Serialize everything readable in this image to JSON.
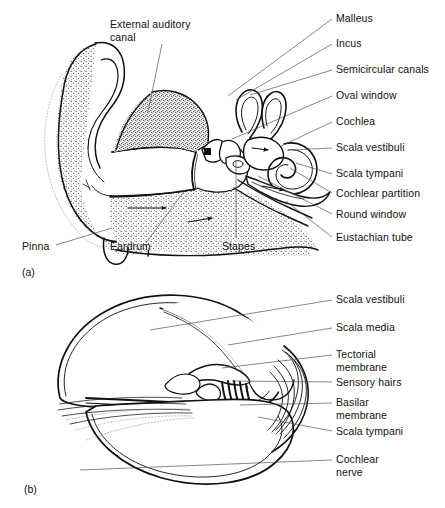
{
  "figure": {
    "background_color": "#ffffff",
    "ink_color": "#111111",
    "width": 445,
    "height": 508
  },
  "panels": [
    {
      "id": "(a)",
      "name": "outer-middle-inner-ear-overview",
      "id_x": 22,
      "id_y": 266,
      "labels": [
        {
          "name": "external-auditory-canal",
          "text": "External auditory\ncanal",
          "x": 110,
          "y": 18,
          "lines": 2,
          "leader": [
            [
              162,
              44
            ],
            [
              148,
              112
            ]
          ]
        },
        {
          "name": "malleus",
          "text": "Malleus",
          "x": 336,
          "y": 12,
          "leader": [
            [
              332,
              19
            ],
            [
              228,
              96
            ]
          ]
        },
        {
          "name": "incus",
          "text": "Incus",
          "x": 336,
          "y": 37,
          "leader": [
            [
              332,
              44
            ],
            [
              236,
              100
            ]
          ]
        },
        {
          "name": "semicircular-canals",
          "text": "Semicircular canals",
          "x": 336,
          "y": 63,
          "leader": [
            [
              332,
              70
            ],
            [
              250,
              95
            ]
          ]
        },
        {
          "name": "oval-window",
          "text": "Oval window",
          "x": 336,
          "y": 89,
          "leader": [
            [
              332,
              96
            ],
            [
              232,
              139
            ]
          ]
        },
        {
          "name": "cochlea",
          "text": "Cochlea",
          "x": 336,
          "y": 115,
          "leader": [
            [
              332,
              122
            ],
            [
              281,
              146
            ]
          ]
        },
        {
          "name": "scala-vestibuli",
          "text": "Scala vestibuli",
          "x": 336,
          "y": 141,
          "leader": [
            [
              332,
              148
            ],
            [
              292,
              150
            ]
          ]
        },
        {
          "name": "scala-tympani",
          "text": "Scala tympani",
          "x": 336,
          "y": 167,
          "leader": [
            [
              332,
              174
            ],
            [
              296,
              163
            ]
          ]
        },
        {
          "name": "cochlear-partition",
          "text": "Cochlear partition",
          "x": 336,
          "y": 187,
          "leader": [
            [
              332,
              193
            ],
            [
              290,
              168
            ]
          ]
        },
        {
          "name": "round-window",
          "text": "Round window",
          "x": 336,
          "y": 208,
          "leader": [
            [
              332,
              214
            ],
            [
              258,
              176
            ]
          ]
        },
        {
          "name": "eustachian-tube",
          "text": "Eustachian tube",
          "x": 336,
          "y": 231,
          "leader": [
            [
              332,
              237
            ],
            [
              286,
              201
            ]
          ]
        },
        {
          "name": "pinna",
          "text": "Pinna",
          "x": 22,
          "y": 240,
          "leader": [
            [
              56,
              245
            ],
            [
              112,
              228
            ]
          ]
        },
        {
          "name": "eardrum",
          "text": "Eardrum",
          "x": 110,
          "y": 240,
          "leader": [
            [
              146,
              243
            ],
            [
              185,
              190
            ]
          ]
        },
        {
          "name": "stapes",
          "text": "Stapes",
          "x": 222,
          "y": 240,
          "leader": [
            [
              236,
              238
            ],
            [
              236,
              160
            ]
          ]
        }
      ]
    },
    {
      "id": "(b)",
      "name": "cochlear-cross-section",
      "id_x": 24,
      "id_y": 483,
      "labels": [
        {
          "name": "scala-vestibuli-b",
          "text": "Scala vestibuli",
          "x": 336,
          "y": 293,
          "leader": [
            [
              332,
              300
            ],
            [
              150,
              330
            ]
          ]
        },
        {
          "name": "scala-media",
          "text": "Scala media",
          "x": 336,
          "y": 321,
          "leader": [
            [
              332,
              328
            ],
            [
              228,
              345
            ]
          ]
        },
        {
          "name": "tectorial-membrane",
          "text": "Tectorial\nmembrane",
          "x": 336,
          "y": 348,
          "lines": 2,
          "leader": [
            [
              332,
              355
            ],
            [
              222,
              368
            ]
          ]
        },
        {
          "name": "sensory-hairs",
          "text": "Sensory hairs",
          "x": 336,
          "y": 376,
          "leader": [
            [
              332,
              382
            ],
            [
              232,
              381
            ]
          ]
        },
        {
          "name": "basilar-membrane",
          "text": "Basilar\nmembrane",
          "x": 336,
          "y": 396,
          "lines": 2,
          "leader": [
            [
              332,
              403
            ],
            [
              240,
              405
            ]
          ]
        },
        {
          "name": "scala-tympani-b",
          "text": "Scala tympani",
          "x": 336,
          "y": 425,
          "leader": [
            [
              332,
              431
            ],
            [
              258,
              417
            ]
          ]
        },
        {
          "name": "cochlear-nerve",
          "text": "Cochlear\nnerve",
          "x": 336,
          "y": 453,
          "lines": 2,
          "leader": [
            [
              332,
              460
            ],
            [
              80,
              470
            ]
          ]
        }
      ]
    }
  ]
}
